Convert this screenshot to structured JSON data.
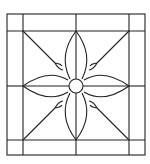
{
  "diagram": {
    "stroke_color": "#222222",
    "background": "#ffffff",
    "frame": {
      "outer": [
        7,
        14,
        145,
        155
      ],
      "inner": [
        23,
        31,
        129,
        140
      ]
    },
    "center": [
      76,
      86
    ],
    "center_circle_radius": 7,
    "petals": 4
  }
}
